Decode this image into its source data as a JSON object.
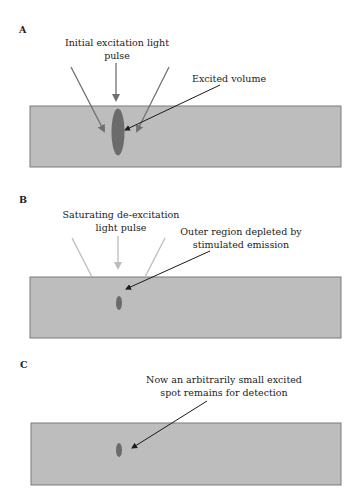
{
  "colors": {
    "background": "#ffffff",
    "medium_fill": "#bdbdbd",
    "medium_border": "#7a7a7a",
    "excited_spot": "#6b6b6b",
    "excitation_arrow": "#707070",
    "deexcitation_arrow": "#bcbcbc",
    "pointer_arrow": "#1a1a1a"
  },
  "panels": [
    {
      "letter": "A",
      "pulse_label_line1": "Initial excitation light",
      "pulse_label_line2": "pulse",
      "annotation_line1": "Excited volume",
      "annotation_line2": "",
      "spot_size": "large"
    },
    {
      "letter": "B",
      "pulse_label_line1": "Saturating de-excitation",
      "pulse_label_line2": "light pulse",
      "annotation_line1": "Outer region depleted by",
      "annotation_line2": "stimulated emission",
      "spot_size": "small"
    },
    {
      "letter": "C",
      "pulse_label_line1": "",
      "pulse_label_line2": "",
      "annotation_line1": "Now an arbitrarily small excited",
      "annotation_line2": "spot remains for detection",
      "spot_size": "small"
    }
  ]
}
